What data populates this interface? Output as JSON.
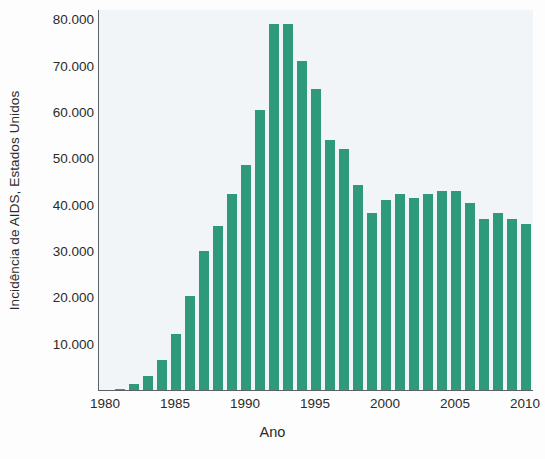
{
  "chart_data": {
    "type": "bar",
    "title": "",
    "xlabel": "Ano",
    "ylabel": "Incidência de AIDS, Estados Unidos",
    "xlim": [
      1979.5,
      2010.5
    ],
    "ylim": [
      0,
      82000
    ],
    "grid": false,
    "legend": null,
    "bar_color": "#2f9a7b",
    "plot_background": "#f1f5f7",
    "axis_color": "#5d6166",
    "ytick_labels": [
      "10.000",
      "20.000",
      "30.000",
      "40.000",
      "50.000",
      "60.000",
      "70.000",
      "80.000"
    ],
    "ytick_values": [
      10000,
      20000,
      30000,
      40000,
      50000,
      60000,
      70000,
      80000
    ],
    "xtick_labels": [
      "1980",
      "1985",
      "1990",
      "1995",
      "2000",
      "2005",
      "2010"
    ],
    "xtick_values": [
      1980,
      1985,
      1990,
      1995,
      2000,
      2005,
      2010
    ],
    "categories": [
      1980,
      1981,
      1982,
      1983,
      1984,
      1985,
      1986,
      1987,
      1988,
      1989,
      1990,
      1991,
      1992,
      1993,
      1994,
      1995,
      1996,
      1997,
      1998,
      1999,
      2000,
      2001,
      2002,
      2003,
      2004,
      2005,
      2006,
      2007,
      2008,
      2009,
      2010
    ],
    "values": [
      0,
      300,
      1400,
      3100,
      6400,
      12000,
      20300,
      30000,
      35400,
      42300,
      48600,
      60500,
      79000,
      79000,
      71000,
      65000,
      54000,
      52000,
      44200,
      38200,
      41000,
      42200,
      41400,
      42200,
      42900,
      42900,
      40300,
      37000,
      38200,
      37000,
      35800
    ]
  }
}
